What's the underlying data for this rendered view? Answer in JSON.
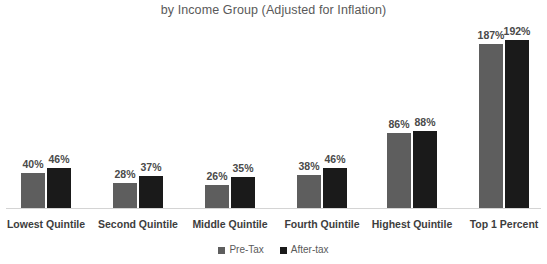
{
  "chart_data": {
    "type": "bar",
    "title": "by Income Group (Adjusted for Inflation)",
    "xlabel": "",
    "ylabel": "",
    "ylim": [
      0,
      200
    ],
    "grid": false,
    "legend_position": "bottom-center",
    "value_suffix": "%",
    "categories": [
      "Lowest Quintile",
      "Second Quintile",
      "Middle Quintile",
      "Fourth Quintile",
      "Highest Quintile",
      "Top 1 Percent"
    ],
    "series": [
      {
        "name": "Pre-Tax",
        "color": "#5e5e5e",
        "values": [
          40,
          28,
          26,
          38,
          86,
          187
        ],
        "labels": [
          "40%",
          "28%",
          "26%",
          "38%",
          "86%",
          "187%"
        ]
      },
      {
        "name": "After-tax",
        "color": "#1a1a1a",
        "values": [
          46,
          37,
          35,
          46,
          88,
          192
        ],
        "labels": [
          "46%",
          "37%",
          "35%",
          "46%",
          "88%",
          "192%"
        ]
      }
    ]
  },
  "legend": {
    "items": [
      {
        "label": "Pre-Tax",
        "color": "#5e5e5e"
      },
      {
        "label": "After-tax",
        "color": "#1a1a1a"
      }
    ]
  },
  "colors": {
    "pre_tax": "#5e5e5e",
    "after_tax": "#1a1a1a",
    "axis": "#d4d4d4",
    "title_text": "#595959",
    "label_text": "#3d3d3d",
    "background": "#ffffff"
  },
  "layout": {
    "baseline_y": 208,
    "px_per_percent": 0.875,
    "bar_width": 24,
    "group_centers": [
      46,
      138,
      230,
      322,
      412,
      504
    ]
  }
}
